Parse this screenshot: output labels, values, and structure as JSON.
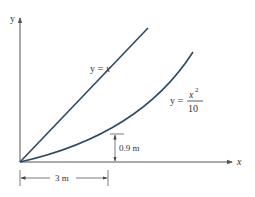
{
  "figure": {
    "axes": {
      "x_label": "x",
      "y_label": "y"
    },
    "curves": [
      {
        "name": "line",
        "label_lhs": "y = ",
        "label_var": "x",
        "equation": "y = x"
      },
      {
        "name": "parabola",
        "label_lhs": "y = ",
        "label_num": "x",
        "label_exp": "2",
        "label_den": "10",
        "equation": "y = x^2/10"
      }
    ],
    "dimensions": {
      "height": {
        "label": "0.9 m",
        "value": 0.9,
        "unit": "m"
      },
      "width": {
        "label": "3 m",
        "value": 3,
        "unit": "m"
      }
    },
    "colors": {
      "curve": "#2d4a63",
      "axis": "#555555",
      "text": "#333333"
    }
  }
}
